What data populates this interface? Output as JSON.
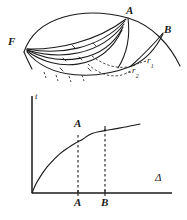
{
  "figure": {
    "background_color": "#ffffff",
    "ink_color": "#1a1a1a",
    "diagram": {
      "name": "crack-front-diagram",
      "labels": {
        "focus": "F",
        "point_a": "A",
        "point_b": "B",
        "radius_1_base": "r",
        "radius_1_sub": "1",
        "radius_2_base": "r",
        "radius_2_sub": "2"
      }
    }
  },
  "chart_data": {
    "type": "line",
    "title": "",
    "xlabel": "Δ",
    "ylabel": "t",
    "grid": false,
    "legend": null,
    "xlim": [
      0,
      1
    ],
    "ylim": [
      0,
      1
    ],
    "x": [
      0.0,
      0.04,
      0.09,
      0.14,
      0.2,
      0.26,
      0.33,
      0.4,
      0.47,
      0.55,
      0.66,
      0.77,
      0.88,
      1.0
    ],
    "y": [
      0.0,
      0.14,
      0.27,
      0.38,
      0.48,
      0.57,
      0.65,
      0.72,
      0.78,
      0.86,
      0.9,
      0.93,
      0.96,
      1.0
    ],
    "annotations": [
      {
        "label": "A",
        "x": 0.33,
        "y": 0.86,
        "kind": "curve-point"
      },
      {
        "label": "B",
        "x": 0.62,
        "y": 0.92,
        "kind": "curve-point"
      }
    ],
    "xticks": [
      {
        "label": "A",
        "x": 0.33
      },
      {
        "label": "B",
        "x": 0.62
      }
    ],
    "yticks": [],
    "dropline_style": "dashed"
  }
}
